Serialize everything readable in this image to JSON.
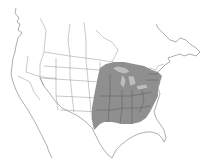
{
  "map": {
    "title": "",
    "region": "North America",
    "shaded_area": "Eastern United States and southern Ontario/Quebec",
    "colors": {
      "background": "#ffffff",
      "range_fill": "#8f8f8f",
      "outline": "#777777"
    }
  }
}
